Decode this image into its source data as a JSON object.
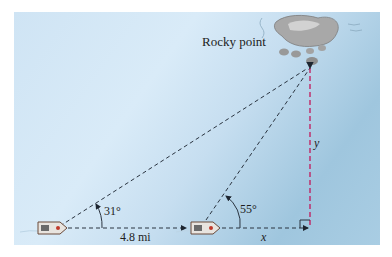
{
  "diagram": {
    "landmark_label": "Rocky point",
    "angle_first": "31°",
    "angle_second": "55°",
    "distance_label": "4.8 mi",
    "segment_x_label": "x",
    "segment_y_label": "y",
    "colors": {
      "water_light": "#d9ebf8",
      "water_dark": "#9fc6de",
      "dashed_line": "#2a3440",
      "height_line": "#c2185b",
      "rock": "#9a9a9a"
    }
  }
}
